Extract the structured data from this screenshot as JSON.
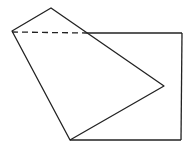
{
  "diagram": {
    "stroke_color": "#222222",
    "background": "#ffffff",
    "rectangle": {
      "top_left": [
        12,
        33
      ],
      "top_right": [
        182,
        33
      ],
      "bottom_right": [
        181,
        140
      ],
      "bottom_left": [
        70,
        140
      ]
    },
    "quadrilateral": {
      "points": [
        [
          12,
          31
        ],
        [
          51,
          8
        ],
        [
          164,
          86
        ],
        [
          70,
          140
        ]
      ]
    },
    "dashed_segment": {
      "from": [
        12,
        32
      ],
      "to": [
        86,
        33
      ]
    },
    "solid_top_segment": {
      "from": [
        86,
        33
      ],
      "to": [
        182,
        33
      ]
    }
  }
}
